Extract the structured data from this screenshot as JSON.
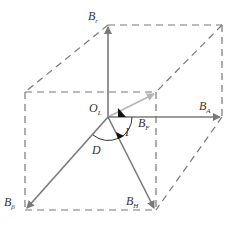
{
  "diagram": {
    "title": "",
    "colors": {
      "arrow": "#7a7a7a",
      "arrow_light": "#b5b5b5",
      "dashed": "#777777",
      "text": "#333333",
      "angle_mark": "#111111"
    },
    "origin": {
      "label": "O",
      "sub": "L"
    },
    "vectors": [
      {
        "id": "B_r",
        "label": "B",
        "sub": "r"
      },
      {
        "id": "B_F",
        "label": "B",
        "sub": "F"
      },
      {
        "id": "B_A",
        "label": "B",
        "sub": "A"
      },
      {
        "id": "B_H",
        "label": "B",
        "sub": "H"
      },
      {
        "id": "B_beta",
        "label": "B",
        "sub": "β"
      }
    ],
    "angles": [
      {
        "id": "I",
        "label": "I"
      },
      {
        "id": "D",
        "label": "D"
      }
    ]
  }
}
